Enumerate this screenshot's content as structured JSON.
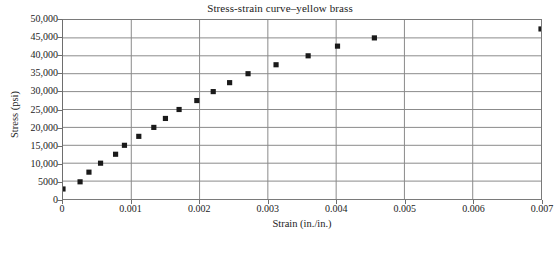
{
  "chart_data": {
    "type": "scatter",
    "title": "Stress-strain curve–yellow brass",
    "xlabel": "Strain (in./in.)",
    "ylabel": "Stress (psi)",
    "xlim": [
      0,
      0.007
    ],
    "ylim": [
      0,
      50000
    ],
    "grid": true,
    "legend": false,
    "marker": "filled-square",
    "marker_color": "#1a1a1a",
    "xticks": [
      0,
      0.001,
      0.002,
      0.003,
      0.004,
      0.005,
      0.006,
      0.007
    ],
    "xtick_labels": [
      "0",
      "0.001",
      "0.002",
      "0.003",
      "0.004",
      "0.005",
      "0.006",
      "0.007"
    ],
    "yticks": [
      0,
      5000,
      10000,
      15000,
      20000,
      25000,
      30000,
      35000,
      40000,
      45000,
      50000
    ],
    "ytick_labels": [
      "0",
      "5000",
      "10,000",
      "15,000",
      "20,000",
      "25,000",
      "30,000",
      "35,000",
      "40,000",
      "45,000",
      "50,000"
    ],
    "series": [
      {
        "name": "yellow brass",
        "x": [
          0.0,
          0.00025,
          0.00038,
          0.00055,
          0.00077,
          0.0009,
          0.00111,
          0.00133,
          0.0015,
          0.0017,
          0.00196,
          0.0022,
          0.00244,
          0.00271,
          0.00312,
          0.00359,
          0.00402,
          0.00456,
          0.007
        ],
        "y": [
          2800,
          4800,
          7500,
          10000,
          12500,
          15000,
          17500,
          20000,
          22500,
          25000,
          27500,
          30000,
          32500,
          35000,
          37500,
          40000,
          42700,
          45000,
          47500
        ]
      }
    ]
  }
}
